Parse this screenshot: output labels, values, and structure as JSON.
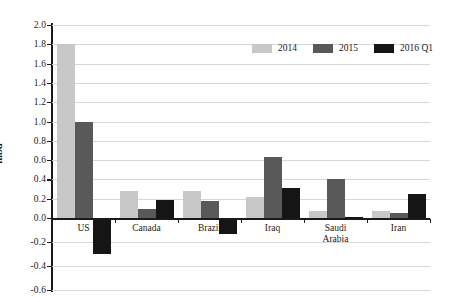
{
  "chart_data": {
    "type": "bar",
    "title": "",
    "xlabel": "",
    "ylabel": "mbd",
    "ylim": [
      -0.6,
      2.0
    ],
    "ytick_step": 0.2,
    "yticks": [
      "2.0",
      "1.8",
      "1.6",
      "1.4",
      "1.2",
      "1.0",
      "0.8",
      "0.6",
      "0.4",
      "0.2",
      "0.0",
      "-0.2",
      "-0.4",
      "-0.6"
    ],
    "ytick_values": [
      2.0,
      1.8,
      1.6,
      1.4,
      1.2,
      1.0,
      0.8,
      0.6,
      0.4,
      0.2,
      0.0,
      -0.2,
      -0.4,
      -0.6
    ],
    "grid": true,
    "legend_position": "top-right",
    "categories": [
      "US",
      "Canada",
      "Brazil",
      "Iraq",
      "Saudi\nArabia",
      "Iran"
    ],
    "series": [
      {
        "name": "2014",
        "color": "#c8c8c8",
        "values": [
          1.8,
          0.28,
          0.28,
          0.22,
          0.07,
          0.07
        ]
      },
      {
        "name": "2015",
        "color": "#595959",
        "values": [
          1.0,
          0.09,
          0.18,
          0.63,
          0.4,
          0.05
        ]
      },
      {
        "name": "2016 Q1",
        "color": "#151515",
        "values": [
          -0.3,
          0.19,
          -0.13,
          0.31,
          0.01,
          0.25
        ]
      }
    ]
  }
}
